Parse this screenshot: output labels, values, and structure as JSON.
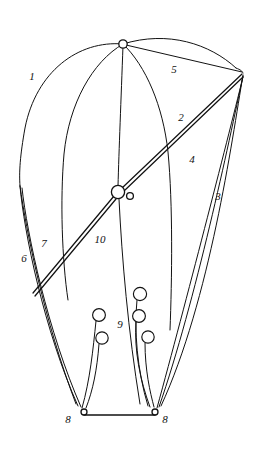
{
  "figure": {
    "kind": "patent-line-drawing",
    "width": 255,
    "height": 450,
    "background_color": "#ffffff",
    "line_color": "#121212"
  },
  "callouts": [
    {
      "id": "1",
      "label": "1",
      "x": 32,
      "y": 77,
      "refers_to": "canopy-leading-edge"
    },
    {
      "id": "2",
      "label": "2",
      "x": 181,
      "y": 118,
      "refers_to": "upper-suspension-line"
    },
    {
      "id": "3",
      "label": "3",
      "x": 218,
      "y": 197,
      "refers_to": "outer-rear-riser-line"
    },
    {
      "id": "4",
      "label": "4",
      "x": 192,
      "y": 160,
      "refers_to": "inner-rear-riser-line"
    },
    {
      "id": "5",
      "label": "5",
      "x": 174,
      "y": 70,
      "refers_to": "apex-to-vertex-line"
    },
    {
      "id": "6",
      "label": "6",
      "x": 24,
      "y": 259,
      "refers_to": "outer-left-line"
    },
    {
      "id": "7",
      "label": "7",
      "x": 44,
      "y": 244,
      "refers_to": "inner-left-line"
    },
    {
      "id": "8a",
      "label": "8",
      "x": 68,
      "y": 420,
      "refers_to": "left-pulley"
    },
    {
      "id": "8b",
      "label": "8",
      "x": 165,
      "y": 420,
      "refers_to": "right-pulley"
    },
    {
      "id": "9",
      "label": "9",
      "x": 120,
      "y": 325,
      "refers_to": "line-guide-rings"
    },
    {
      "id": "10",
      "label": "10",
      "x": 100,
      "y": 240,
      "refers_to": "central-spar-beam"
    }
  ],
  "nodes": {
    "apex": {
      "x": 123,
      "y": 44,
      "r": 4.2,
      "name": "canopy-apex-node"
    },
    "right_vertex": {
      "x": 243,
      "y": 73,
      "r": 0,
      "name": "right-convergence-vertex"
    },
    "hub_main": {
      "x": 118,
      "y": 192,
      "r": 6.6,
      "name": "center-hub-ring"
    },
    "hub_small": {
      "x": 130,
      "y": 196,
      "r": 3.4,
      "name": "center-hub-small-ring"
    },
    "left_pulley": {
      "x": 84,
      "y": 412,
      "r": 3.0,
      "name": "left-pulley-ring"
    },
    "right_pulley": {
      "x": 155,
      "y": 412,
      "r": 3.0,
      "name": "right-pulley-ring"
    }
  },
  "rings": [
    {
      "name": "ring-left-upper",
      "x": 99,
      "y": 315,
      "r": 6.4
    },
    {
      "name": "ring-left-lower",
      "x": 102,
      "y": 338,
      "r": 6.2
    },
    {
      "name": "ring-right-top",
      "x": 140,
      "y": 294,
      "r": 6.6
    },
    {
      "name": "ring-right-mid",
      "x": 139,
      "y": 316,
      "r": 6.4
    },
    {
      "name": "ring-right-lower",
      "x": 148,
      "y": 337,
      "r": 6.2
    }
  ],
  "paths": {
    "canopy_outer_left": "M123,44 C78,40 36,72 25,128 C20,156 19,172 20,186",
    "canopy_outer_top": "M123,44 C168,30 210,44 236,68",
    "canopy_inner_left": "M123,44 C92,62 69,104 64,154 C60,200 62,260 68,300",
    "canopy_inner_right": "M123,44 C146,66 163,106 168,152 C173,204 172,280 170,330",
    "canopy_rim_right": "M236,68 C241,70 242,71 243,73",
    "left_edge_to_pulley_outer": "M20,186 C24,232 44,330 78,406",
    "left_edge_to_pulley_inner": "M22,188 C27,234 48,332 81,407",
    "apex_to_hub": "M123,46 C121,100 119,150 118,186",
    "hub_to_bottom": "M119,199 C122,260 128,330 140,404",
    "apex_to_vertex": "M126,45 L242,72",
    "vertex_line_a": "M243,75 C232,140 210,300 161,406",
    "vertex_line_b": "M243,76 C229,142 196,300 159,407",
    "vertex_line_c": "M243,77 C226,146 186,302 157,408",
    "spar_top": "M242,74 L122,188",
    "spar_bot": "M243,77 L124,191",
    "spar_lower_top": "M114,196 L33,293",
    "spar_lower_bot": "M116,199 L35,296",
    "ring_stem_left_upper": "M96,321 C93,350 90,380 82,408",
    "ring_stem_left_lower": "M99,344 C97,370 93,390 86,408",
    "ring_stem_right_top": "M137,300 C134,330 137,370 148,406",
    "ring_stem_right_mid": "M136,322 C134,350 140,380 150,407",
    "ring_stem_right_lower": "M145,343 C145,370 150,392 154,407",
    "control_bar": "M84,415 L155,415",
    "canopy_left_tail": "M20,186 C26,230 44,320 76,404"
  }
}
